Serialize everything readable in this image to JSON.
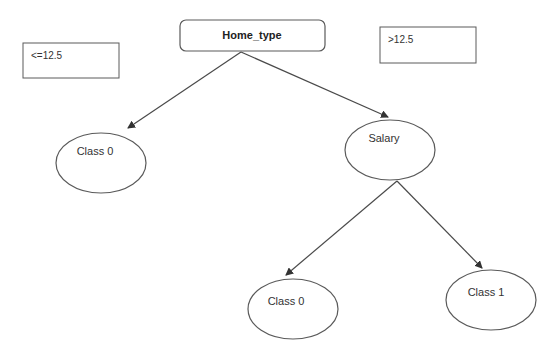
{
  "diagram": {
    "type": "decision-tree",
    "root": {
      "label": "Home_type",
      "shape": "rounded-rectangle"
    },
    "split_labels": {
      "left": "<=12.5",
      "right": ">12.5"
    },
    "nodes": [
      {
        "id": "class0-left",
        "label": "Class 0",
        "shape": "ellipse",
        "parent": "root"
      },
      {
        "id": "salary",
        "label": "Salary",
        "shape": "ellipse",
        "parent": "root"
      },
      {
        "id": "class0-bottom",
        "label": "Class 0",
        "shape": "ellipse",
        "parent": "salary"
      },
      {
        "id": "class1",
        "label": "Class 1",
        "shape": "ellipse",
        "parent": "salary"
      }
    ],
    "edges": [
      {
        "from": "root",
        "to": "class0-left"
      },
      {
        "from": "root",
        "to": "salary"
      },
      {
        "from": "salary",
        "to": "class0-bottom"
      },
      {
        "from": "salary",
        "to": "class1"
      }
    ],
    "colors": {
      "stroke": "#5a5a5a",
      "text": "#333333",
      "background": "#ffffff"
    }
  }
}
